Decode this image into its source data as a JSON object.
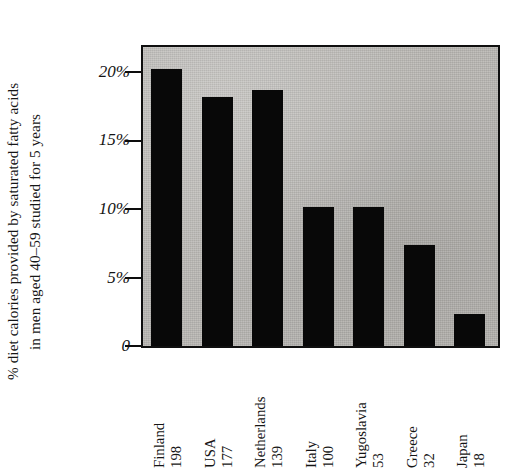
{
  "chart_data": {
    "type": "bar",
    "title": "",
    "xlabel": "",
    "ylabel": "% diet calories provided by saturated fatty acids in men aged 40–59 studied for 5 years",
    "ylabel_lines": [
      "% diet calories provided by saturated fatty acids",
      "in men aged 40–59 studied for 5 years"
    ],
    "categories": [
      "Finland",
      "USA",
      "Netherlands",
      "Italy",
      "Yugoslavia",
      "Greece",
      "Japan"
    ],
    "category_numbers": [
      198,
      177,
      139,
      100,
      53,
      32,
      18
    ],
    "values": [
      20.0,
      18.0,
      18.5,
      10.0,
      10.0,
      7.3,
      2.3
    ],
    "value_unit": "%",
    "ylim": [
      0,
      21.5
    ],
    "yticks": [
      0,
      5,
      10,
      15,
      20
    ],
    "ytick_labels": [
      "0",
      "5%",
      "10%",
      "15%",
      "20%"
    ],
    "grid": false,
    "legend": false,
    "legend_position": "none",
    "bar_color": "#080808",
    "panel_background": "#b9b7b3",
    "axis_color": "#0f0f0f",
    "note": "Bars have drop shadows to the upper-right; x tick labels rotated 90 degrees showing country name and a number below it."
  },
  "axis": {
    "y_title_line1": "% diet calories provided by saturated fatty acids",
    "y_title_line2": "in men aged 40–59 studied for 5 years",
    "y_ticks": [
      {
        "label": "20%",
        "value": 20
      },
      {
        "label": "15%",
        "value": 15
      },
      {
        "label": "10%",
        "value": 10
      },
      {
        "label": "5%",
        "value": 5
      },
      {
        "label": "0",
        "value": 0
      }
    ]
  },
  "bars": [
    {
      "name": "Finland",
      "number": "198",
      "value": 20.0
    },
    {
      "name": "USA",
      "number": "177",
      "value": 18.0
    },
    {
      "name": "Netherlands",
      "number": "139",
      "value": 18.5
    },
    {
      "name": "Italy",
      "number": "100",
      "value": 10.0
    },
    {
      "name": "Yugoslavia",
      "number": "53",
      "value": 10.0
    },
    {
      "name": "Greece",
      "number": "32",
      "value": 7.3
    },
    {
      "name": "Japan",
      "number": "18",
      "value": 2.3
    }
  ]
}
